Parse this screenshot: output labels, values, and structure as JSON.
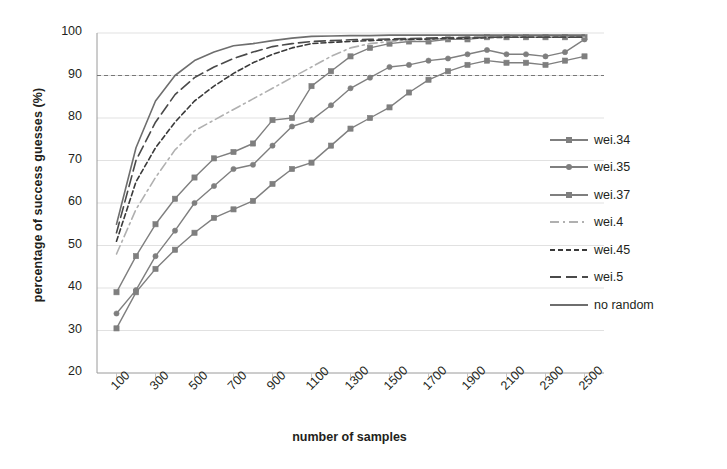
{
  "chart_data": {
    "type": "line",
    "title": "",
    "xlabel": "number of samples",
    "ylabel": "percentage of success guesses (%)",
    "xlim": [
      0,
      2600
    ],
    "ylim": [
      20,
      100
    ],
    "grid": true,
    "legend_position": "right",
    "yticks": [
      20,
      30,
      40,
      50,
      60,
      70,
      80,
      90,
      100
    ],
    "xticks": [
      100,
      300,
      500,
      700,
      900,
      1100,
      1300,
      1500,
      1700,
      1900,
      2100,
      2300,
      2500
    ],
    "reference_line": {
      "value": 90,
      "style": "dashed"
    },
    "x": [
      100,
      200,
      300,
      400,
      500,
      600,
      700,
      800,
      900,
      1000,
      1100,
      1200,
      1300,
      1400,
      1500,
      1600,
      1700,
      1800,
      1900,
      2000,
      2100,
      2200,
      2300,
      2400,
      2500
    ],
    "series": [
      {
        "name": "wei.34",
        "color": "#7f7f7f",
        "style": "solid",
        "marker": "square",
        "values": [
          30.5,
          39.0,
          44.5,
          49.0,
          53.0,
          56.5,
          58.5,
          60.5,
          64.5,
          68.0,
          69.5,
          73.5,
          77.5,
          80.0,
          82.5,
          86.0,
          89.0,
          91.0,
          92.5,
          93.5,
          93.0,
          93.0,
          92.5,
          93.5,
          94.5
        ]
      },
      {
        "name": "wei.35",
        "color": "#7f7f7f",
        "style": "solid",
        "marker": "circle",
        "values": [
          34.0,
          39.5,
          47.5,
          53.5,
          60.0,
          64.0,
          68.0,
          69.0,
          73.5,
          78.0,
          79.5,
          83.0,
          87.0,
          89.5,
          92.0,
          92.5,
          93.5,
          94.0,
          95.0,
          96.0,
          95.0,
          95.0,
          94.5,
          95.5,
          98.5
        ]
      },
      {
        "name": "wei.37",
        "color": "#7f7f7f",
        "style": "solid",
        "marker": "square",
        "values": [
          39.0,
          47.5,
          55.0,
          61.0,
          66.0,
          70.5,
          72.0,
          74.0,
          79.5,
          80.0,
          87.5,
          91.0,
          94.5,
          96.5,
          97.5,
          98.0,
          98.0,
          98.5,
          98.5,
          99.0,
          99.0,
          99.0,
          99.0,
          99.0,
          99.0
        ]
      },
      {
        "name": "wei.4",
        "color": "#b0b0b0",
        "style": "dashdot",
        "marker": "none",
        "values": [
          48.0,
          58.5,
          66.0,
          72.5,
          77.0,
          79.5,
          82.0,
          84.5,
          87.0,
          89.5,
          92.0,
          94.5,
          96.5,
          97.5,
          98.0,
          98.3,
          98.5,
          98.7,
          98.8,
          99.0,
          99.0,
          99.0,
          99.0,
          99.0,
          99.0
        ]
      },
      {
        "name": "wei.45",
        "color": "#3a3a3a",
        "style": "dashed-short",
        "marker": "none",
        "values": [
          51.0,
          65.0,
          73.0,
          79.0,
          84.0,
          87.5,
          90.5,
          93.0,
          95.0,
          96.5,
          97.5,
          97.8,
          98.0,
          98.2,
          98.4,
          98.5,
          98.6,
          98.7,
          98.8,
          98.9,
          99.0,
          99.0,
          99.0,
          99.0,
          99.0
        ]
      },
      {
        "name": "wei.5",
        "color": "#4a4a4a",
        "style": "dashed-long",
        "marker": "none",
        "values": [
          53.0,
          70.0,
          79.0,
          85.5,
          89.5,
          92.0,
          94.0,
          95.5,
          96.8,
          97.5,
          98.0,
          98.2,
          98.4,
          98.5,
          98.6,
          98.7,
          98.8,
          98.9,
          99.0,
          99.0,
          99.0,
          99.0,
          99.0,
          99.0,
          99.0
        ]
      },
      {
        "name": "no random",
        "color": "#6e6e6e",
        "style": "solid",
        "marker": "none",
        "values": [
          55.0,
          73.0,
          84.0,
          90.0,
          93.5,
          95.5,
          97.0,
          97.5,
          98.2,
          98.8,
          99.2,
          99.3,
          99.4,
          99.4,
          99.5,
          99.5,
          99.5,
          99.5,
          99.5,
          99.5,
          99.5,
          99.5,
          99.5,
          99.5,
          99.5
        ]
      }
    ]
  },
  "legend": {
    "items": [
      {
        "label": "wei.34"
      },
      {
        "label": "wei.35"
      },
      {
        "label": "wei.37"
      },
      {
        "label": "wei.4"
      },
      {
        "label": "wei.45"
      },
      {
        "label": "wei.5"
      },
      {
        "label": "no random"
      }
    ]
  }
}
